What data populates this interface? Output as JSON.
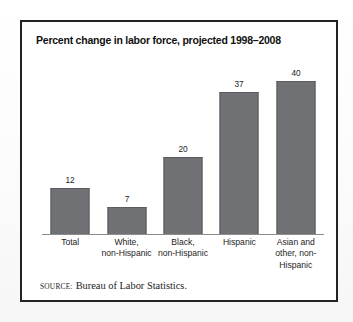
{
  "figure": {
    "title": "Percent change in labor force, projected 1998–2008",
    "source_label": "Source:",
    "source_text": "Bureau of Labor Statistics.",
    "frame_color": "#232323",
    "bar_fill": "#6f7174",
    "bar_stroke": "#5a5c5f",
    "axis_color": "#8d8d8d",
    "background": "#ffffff"
  },
  "chart_data": {
    "type": "bar",
    "title": "Percent change in labor force, projected 1998–2008",
    "xlabel": "",
    "ylabel": "",
    "ylim": [
      0,
      48
    ],
    "grid": false,
    "legend": "none",
    "value_labels": true,
    "units": "percent",
    "categories": [
      "Total",
      "White, non-Hispanic",
      "Black, non-Hispanic",
      "Hispanic",
      "Asian and other, non-Hispanic"
    ],
    "category_lines": [
      [
        "Total"
      ],
      [
        "White,",
        "non-Hispanic"
      ],
      [
        "Black,",
        "non-Hispanic"
      ],
      [
        "Hispanic"
      ],
      [
        "Asian and",
        "other, non-",
        "Hispanic"
      ]
    ],
    "values": [
      12,
      7,
      20,
      37,
      40
    ],
    "value_text": [
      "12",
      "7",
      "20",
      "37",
      "40"
    ]
  }
}
